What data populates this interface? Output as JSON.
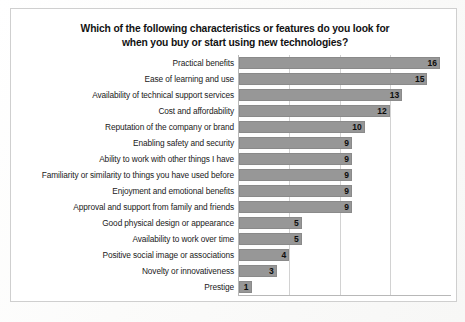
{
  "chart_data": {
    "type": "bar",
    "orientation": "horizontal",
    "title": "Which of the following characteristics or features do you look for when you buy or start using new technologies?",
    "title_line1": "Which of the following characteristics or features do you look for",
    "title_line2": "when you buy or start using new technologies?",
    "xlabel": "",
    "ylabel": "",
    "xlim": [
      0,
      16
    ],
    "grid": true,
    "gridlines": [
      4,
      8,
      12
    ],
    "legend": "none",
    "bar_color": "#979797",
    "categories": [
      "Practical benefits",
      "Ease of learning and use",
      "Availability of technical support services",
      "Cost and affordability",
      "Reputation of the company or brand",
      "Enabling safety and security",
      "Ability to work with other things I have",
      "Familiarity or similarity to things you have used before",
      "Enjoyment and emotional benefits",
      "Approval and support from family and friends",
      "Good physical design or appearance",
      "Availability to work over time",
      "Positive social image or associations",
      "Novelty or innovativeness",
      "Prestige"
    ],
    "values": [
      16,
      15,
      13,
      12,
      10,
      9,
      9,
      9,
      9,
      9,
      5,
      5,
      4,
      3,
      1
    ],
    "data_labels": [
      "16",
      "15",
      "13",
      "12",
      "10",
      "9",
      "9",
      "9",
      "9",
      "9",
      "5",
      "5",
      "4",
      "3",
      "1"
    ]
  }
}
